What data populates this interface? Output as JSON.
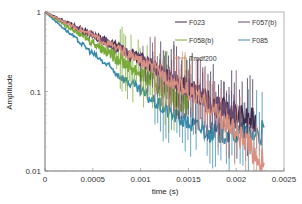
{
  "chart_data": {
    "type": "line",
    "title": "",
    "xlabel": "time (s)",
    "ylabel": "Amplitude",
    "xscale": "linear",
    "yscale": "log",
    "xlim": [
      0,
      0.0025
    ],
    "ylim": [
      0.01,
      1
    ],
    "x_ticks": [
      "0",
      "0.0005",
      "0.001",
      "0.0015",
      "0.002",
      "0.0025"
    ],
    "y_ticks": [
      "0.01",
      "0.1",
      "1"
    ],
    "grid": false,
    "legend_position": "upper right (inside plot)",
    "series": [
      {
        "name": "F023",
        "color": "#3b2b4f",
        "x": [
          0,
          0.00025,
          0.0005,
          0.00075,
          0.001,
          0.00125,
          0.0015,
          0.00175,
          0.002,
          0.0022
        ],
        "values": [
          1,
          0.72,
          0.52,
          0.37,
          0.26,
          0.18,
          0.11,
          0.07,
          0.05,
          0.04
        ]
      },
      {
        "name": "F057(b)",
        "color": "#6b4a6e",
        "x": [
          0,
          0.00025,
          0.0005,
          0.00075,
          0.001,
          0.00125,
          0.0015,
          0.00175,
          0.002
        ],
        "values": [
          1,
          0.71,
          0.51,
          0.36,
          0.25,
          0.17,
          0.11,
          0.07,
          0.05
        ]
      },
      {
        "name": "F058(b)",
        "color": "#7aab3a",
        "x": [
          0,
          0.00025,
          0.0005,
          0.00075,
          0.001,
          0.00125,
          0.0015
        ],
        "values": [
          1,
          0.65,
          0.42,
          0.27,
          0.17,
          0.11,
          0.07
        ]
      },
      {
        "name": "F085",
        "color": "#3a8bab",
        "x": [
          0,
          0.00025,
          0.0005,
          0.00075,
          0.001,
          0.00125,
          0.0015,
          0.00175,
          0.002,
          0.0023
        ],
        "values": [
          1,
          0.55,
          0.3,
          0.17,
          0.1,
          0.06,
          0.04,
          0.03,
          0.03,
          0.03
        ]
      },
      {
        "name": "Tmdf200",
        "color": "#d89080",
        "x": [
          0,
          0.00025,
          0.0005,
          0.00075,
          0.001,
          0.00125,
          0.0015,
          0.00175,
          0.002,
          0.0023
        ],
        "values": [
          1,
          0.7,
          0.5,
          0.35,
          0.24,
          0.16,
          0.1,
          0.06,
          0.03,
          0.012
        ]
      }
    ]
  },
  "legend": {
    "items": [
      {
        "label": "F023",
        "color": "#3b2b4f"
      },
      {
        "label": "F057(b)",
        "color": "#6b4a6e"
      },
      {
        "label": "F058(b)",
        "color": "#7aab3a"
      },
      {
        "label": "F085",
        "color": "#3a8bab"
      },
      {
        "label": "Tmdf200",
        "color": "#d89080"
      }
    ]
  },
  "axes": {
    "xlabel": "time (s)",
    "ylabel": "Amplitude"
  }
}
